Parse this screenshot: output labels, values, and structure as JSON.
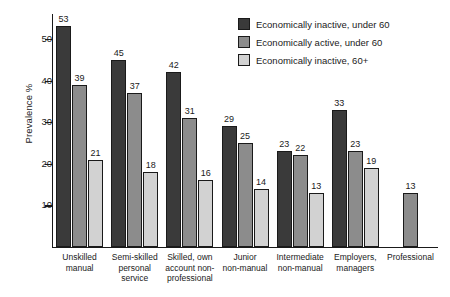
{
  "chart_data": {
    "type": "bar",
    "title": "",
    "xlabel": "",
    "ylabel": "Prevalence %",
    "ylim": [
      0,
      56
    ],
    "yticks": [
      10,
      20,
      30,
      40,
      50
    ],
    "grid": false,
    "legend_position": "top-right",
    "categories": [
      "Unskilled manual",
      "Semi-skilled personal service",
      "Skilled, own account non-professional",
      "Junior non-manual",
      "Intermediate non-manual",
      "Employers, managers",
      "Professional"
    ],
    "category_lines": [
      [
        "Unskilled",
        "manual"
      ],
      [
        "Semi-skilled",
        "personal",
        "service"
      ],
      [
        "Skilled, own",
        "account non-",
        "professional"
      ],
      [
        "Junior",
        "non-manual"
      ],
      [
        "Intermediate",
        "non-manual"
      ],
      [
        "Employers,",
        "managers"
      ],
      [
        "Professional"
      ]
    ],
    "series": [
      {
        "name": "Economically inactive, under 60",
        "color": "#3a3a3a",
        "values": [
          53,
          45,
          42,
          29,
          23,
          33,
          null
        ]
      },
      {
        "name": "Economically active, under 60",
        "color": "#8c8c8c",
        "values": [
          39,
          37,
          31,
          25,
          22,
          23,
          13
        ]
      },
      {
        "name": "Economically inactive, 60+",
        "color": "#d2d2d2",
        "values": [
          21,
          18,
          16,
          14,
          13,
          19,
          null
        ]
      }
    ]
  },
  "axis": {
    "y_title": "Prevalence %",
    "y_tick_labels": [
      "10",
      "20",
      "30",
      "40",
      "50"
    ]
  }
}
